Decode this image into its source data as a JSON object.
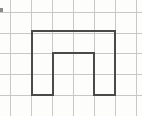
{
  "figure": {
    "title": "Arch polygon on graph paper",
    "width": 142,
    "height": 116,
    "background_color": "#fdfdfc"
  },
  "grid": {
    "label": "graph-paper-grid",
    "line_color": "#c8c8c8",
    "line_width": 1,
    "spacing_px": 21,
    "vertical_lines_x": [
      10,
      31,
      52,
      73,
      94,
      115,
      136
    ],
    "horizontal_lines_y": [
      12,
      33,
      53,
      74,
      95
    ]
  },
  "shape": {
    "label": "arch-polygon",
    "type": "polygon",
    "stroke_color": "#4a4a4a",
    "stroke_width": 2,
    "fill": "none",
    "description": "Inverted U / arch: outer rectangle with a rectangular notch removed from the bottom center",
    "vertices": [
      {
        "x": 32,
        "y": 95
      },
      {
        "x": 32,
        "y": 31
      },
      {
        "x": 115,
        "y": 31
      },
      {
        "x": 115,
        "y": 95
      },
      {
        "x": 94,
        "y": 95
      },
      {
        "x": 94,
        "y": 53
      },
      {
        "x": 53,
        "y": 53
      },
      {
        "x": 53,
        "y": 95
      }
    ],
    "points_string": "32,95 32,31 115,31 115,95 94,95 94,53 53,53 53,95 32,95",
    "outer_bounds": {
      "left": 32,
      "top": 31,
      "right": 115,
      "bottom": 95,
      "width": 83,
      "height": 64
    },
    "notch": {
      "left": 53,
      "top": 53,
      "right": 94,
      "bottom": 95,
      "width": 41,
      "height": 42
    },
    "left_leg": {
      "left": 32,
      "right": 53,
      "width": 21
    },
    "right_leg": {
      "left": 94,
      "right": 115,
      "width": 21
    },
    "top_bar_height": 22
  },
  "mark": {
    "label": "edge-smudge",
    "color": "#8a8a8a",
    "x": 0,
    "y": 8,
    "width": 3,
    "height": 4
  }
}
